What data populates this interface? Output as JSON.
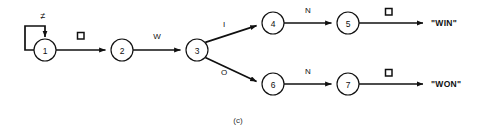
{
  "figure": {
    "caption": "(c)",
    "kind": "state-transition-diagram"
  },
  "states": [
    {
      "id": "1",
      "label": "1",
      "cx": 45,
      "cy": 50,
      "r": 11
    },
    {
      "id": "2",
      "label": "2",
      "cx": 122,
      "cy": 50,
      "r": 11
    },
    {
      "id": "3",
      "label": "3",
      "cx": 197,
      "cy": 50,
      "r": 11
    },
    {
      "id": "4",
      "label": "4",
      "cx": 273,
      "cy": 23,
      "r": 11
    },
    {
      "id": "5",
      "label": "5",
      "cx": 348,
      "cy": 23,
      "r": 11
    },
    {
      "id": "6",
      "label": "6",
      "cx": 273,
      "cy": 84,
      "r": 11
    },
    {
      "id": "7",
      "label": "7",
      "cx": 348,
      "cy": 84,
      "r": 11
    }
  ],
  "edges": [
    {
      "from": "1",
      "to": "1",
      "label": "≠",
      "label_kind": "text",
      "name": "edge-1-self-loop"
    },
    {
      "from": "1",
      "to": "2",
      "label": "□",
      "label_kind": "square",
      "name": "edge-1-to-2"
    },
    {
      "from": "2",
      "to": "3",
      "label": "W",
      "label_kind": "text",
      "name": "edge-2-to-3"
    },
    {
      "from": "3",
      "to": "4",
      "label": "I",
      "label_kind": "text",
      "name": "edge-3-to-4"
    },
    {
      "from": "3",
      "to": "6",
      "label": "O",
      "label_kind": "text",
      "name": "edge-3-to-6"
    },
    {
      "from": "4",
      "to": "5",
      "label": "N",
      "label_kind": "text",
      "name": "edge-4-to-5"
    },
    {
      "from": "5",
      "to": "win",
      "label": "□",
      "label_kind": "square",
      "name": "edge-5-to-win"
    },
    {
      "from": "6",
      "to": "7",
      "label": "N",
      "label_kind": "text",
      "name": "edge-6-to-7"
    },
    {
      "from": "7",
      "to": "won",
      "label": "□",
      "label_kind": "square",
      "name": "edge-7-to-won"
    }
  ],
  "outputs": [
    {
      "id": "win",
      "text": "\"WIN\"",
      "x": 431,
      "y": 23
    },
    {
      "id": "won",
      "text": "\"WON\"",
      "x": 431,
      "y": 84
    }
  ],
  "edge_labels": {
    "loop_not_equal": "≠",
    "blank_1_2": "□",
    "w": "W",
    "i": "I",
    "o": "O",
    "n_upper": "N",
    "n_lower": "N",
    "blank_5_win": "□",
    "blank_7_won": "□"
  },
  "state_labels": {
    "s1": "1",
    "s2": "2",
    "s3": "3",
    "s4": "4",
    "s5": "5",
    "s6": "6",
    "s7": "7"
  },
  "colors": {
    "ink": "#101010",
    "background": "#ffffff",
    "caption": "#303030"
  }
}
